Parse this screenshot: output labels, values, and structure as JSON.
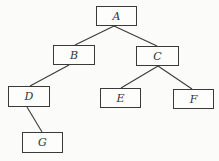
{
  "diagram": {
    "type": "tree",
    "colors": {
      "background": "#fbfbf9",
      "stroke": "#3a3a3a",
      "text": "#333333"
    },
    "nodes": [
      {
        "id": "A",
        "label": "A",
        "x": 96,
        "y": 6,
        "w": 41,
        "h": 20
      },
      {
        "id": "B",
        "label": "B",
        "x": 53,
        "y": 45,
        "w": 42,
        "h": 20
      },
      {
        "id": "C",
        "label": "C",
        "x": 136,
        "y": 46,
        "w": 43,
        "h": 20
      },
      {
        "id": "D",
        "label": "D",
        "x": 8,
        "y": 86,
        "w": 42,
        "h": 21
      },
      {
        "id": "E",
        "label": "E",
        "x": 100,
        "y": 88,
        "w": 41,
        "h": 20
      },
      {
        "id": "F",
        "label": "F",
        "x": 173,
        "y": 89,
        "w": 41,
        "h": 20
      },
      {
        "id": "G",
        "label": "G",
        "x": 22,
        "y": 132,
        "w": 41,
        "h": 21
      }
    ],
    "edges": [
      {
        "from": "A",
        "to": "B",
        "x1": 114,
        "y1": 26,
        "x2": 75,
        "y2": 45
      },
      {
        "from": "A",
        "to": "C",
        "x1": 114,
        "y1": 26,
        "x2": 157,
        "y2": 46
      },
      {
        "from": "B",
        "to": "D",
        "x1": 69,
        "y1": 65,
        "x2": 30,
        "y2": 86
      },
      {
        "from": "C",
        "to": "E",
        "x1": 158,
        "y1": 66,
        "x2": 121,
        "y2": 88
      },
      {
        "from": "C",
        "to": "F",
        "x1": 158,
        "y1": 66,
        "x2": 192,
        "y2": 89
      },
      {
        "from": "D",
        "to": "G",
        "x1": 27,
        "y1": 107,
        "x2": 42,
        "y2": 132
      }
    ]
  }
}
